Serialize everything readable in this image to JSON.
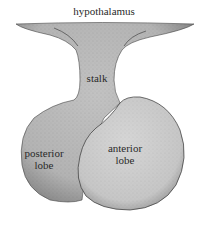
{
  "diagram": {
    "labels": {
      "hypothalamus": "hypothalamus",
      "stalk": "stalk",
      "posterior_line1": "posterior",
      "posterior_line2": "lobe",
      "anterior_line1": "anterior",
      "anterior_line2": "lobe"
    },
    "colors": {
      "posterior_fill": "#b9b9b9",
      "anterior_fill": "#cfcfcf",
      "stalk_fill": "#bdbdbd",
      "outline": "#333333",
      "stipple": "#555555",
      "background": "#ffffff"
    }
  }
}
